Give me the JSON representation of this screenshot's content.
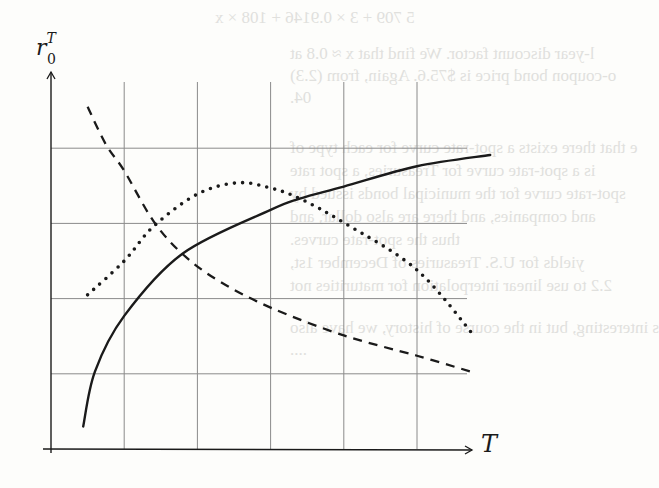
{
  "bleed_through_text": [
    {
      "text": "5 709 + 3 × 0.9146 + 108 × x",
      "x": 215,
      "y": 8
    },
    {
      "text": "l-year discount factor. We find that x ≈ 0.8 at",
      "x": 290,
      "y": 44
    },
    {
      "text": "o-coupon bond price is $75.6. Again, from (2.3)",
      "x": 290,
      "y": 66
    },
    {
      "text": "04.",
      "x": 290,
      "y": 88
    },
    {
      "text": "e that there exists a spot-rate curve for each type of",
      "x": 290,
      "y": 138
    },
    {
      "text": "is a spot-rate curve for Treasuries, a spot rate",
      "x": 290,
      "y": 161
    },
    {
      "text": "spot-rate curve for the municipal bonds issued by",
      "x": 290,
      "y": 184
    },
    {
      "text": "and companies, and there are also dollar, and",
      "x": 290,
      "y": 207
    },
    {
      "text": "thus the spot-rate curves.",
      "x": 290,
      "y": 230
    },
    {
      "text": "yields for U.S. Treasuries of December 1st,",
      "x": 290,
      "y": 253
    },
    {
      "text": "2.2 to use linear interpolation for maturities not",
      "x": 290,
      "y": 276
    },
    {
      "text": "s interesting, but in the course of history, we have also",
      "x": 290,
      "y": 318
    },
    {
      "text": "               ....",
      "x": 290,
      "y": 340
    }
  ],
  "chart_data": {
    "type": "line",
    "title": "",
    "xlabel": "T",
    "ylabel": "r_0^T",
    "ylabel_display": {
      "base": "r",
      "sup": "T",
      "sub": "0"
    },
    "xlim": [
      0,
      6
    ],
    "ylim": [
      0,
      5
    ],
    "grid": true,
    "grid_x": [
      1,
      2,
      3,
      4,
      5
    ],
    "grid_y": [
      1,
      2,
      3,
      4
    ],
    "x_tick_labels": [],
    "y_tick_labels": [],
    "legend": null,
    "series": [
      {
        "name": "solid (increasing, concave)",
        "style": "solid",
        "x": [
          0.44,
          0.6,
          1.0,
          1.8,
          3.0,
          3.4,
          4.0,
          5.0,
          6.0
        ],
        "y": [
          0.3,
          1.03,
          1.77,
          2.6,
          3.18,
          3.33,
          3.49,
          3.76,
          3.91
        ]
      },
      {
        "name": "dotted (humped)",
        "style": "dotted",
        "x": [
          0.5,
          1.0,
          1.4,
          2.0,
          2.55,
          3.0,
          3.4,
          4.0,
          5.0,
          5.8
        ],
        "y": [
          2.05,
          2.5,
          2.96,
          3.39,
          3.54,
          3.47,
          3.33,
          3.01,
          2.38,
          1.48
        ]
      },
      {
        "name": "dashed (decreasing)",
        "style": "dashed",
        "x": [
          0.5,
          0.75,
          1.0,
          1.4,
          1.8,
          2.3,
          3.0,
          4.0,
          5.0,
          5.8
        ],
        "y": [
          4.55,
          4.05,
          3.7,
          3.03,
          2.59,
          2.23,
          1.88,
          1.51,
          1.24,
          1.01
        ]
      }
    ]
  },
  "render": {
    "origin_px": [
      51,
      449
    ],
    "x_unit_px": 73.2,
    "y_unit_px": 75.2,
    "grid_right_px": 467,
    "grid_top_px": 82,
    "x_axis_end_px": 472,
    "y_axis_top_px": 72,
    "line_color": "#1a1a1a",
    "grid_color": "#8a8a8a"
  }
}
